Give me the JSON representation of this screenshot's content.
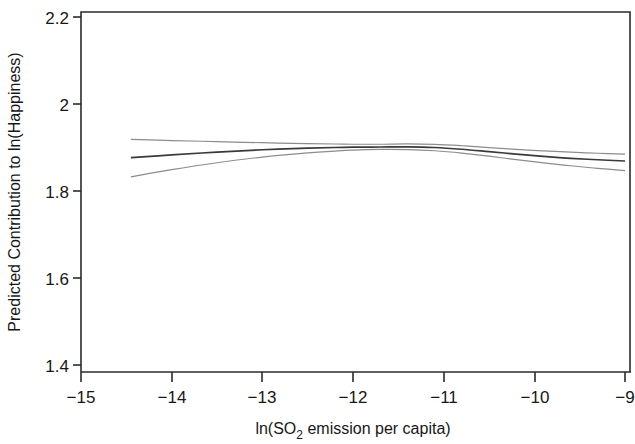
{
  "chart_data": {
    "type": "line",
    "title": "",
    "xlabel": "ln(SO2 emission per capita)",
    "xlabel_main": "ln(SO",
    "xlabel_sub": "2",
    "xlabel_tail": " emission per capita)",
    "ylabel": "Predicted Contribution to ln(Happiness)",
    "xlim": [
      -15,
      -9
    ],
    "ylim": [
      1.4,
      2.2
    ],
    "xticks": [
      -15,
      -14,
      -13,
      -12,
      -11,
      -10,
      -9
    ],
    "xtick_labels": [
      "−15",
      "−14",
      "−13",
      "−12",
      "−11",
      "−10",
      "−9"
    ],
    "yticks": [
      1.4,
      1.6,
      1.8,
      2.0,
      2.2
    ],
    "ytick_labels": [
      "1.4",
      "1.6",
      "1.8",
      "2",
      "2.2"
    ],
    "grid": false,
    "legend": "none",
    "series": [
      {
        "name": "Upper confidence band",
        "style": "thin-gray",
        "color": "#8c8c8c",
        "x": [
          -14.45,
          -14.0,
          -13.5,
          -13.0,
          -12.5,
          -12.2,
          -12.0,
          -11.7,
          -11.4,
          -11.1,
          -10.8,
          -10.5,
          -10.2,
          -9.9,
          -9.6,
          -9.3,
          -9.0
        ],
        "y": [
          1.9185,
          1.916,
          1.9135,
          1.911,
          1.909,
          1.908,
          1.9075,
          1.9075,
          1.9082,
          1.9072,
          1.904,
          1.8998,
          1.8958,
          1.8922,
          1.8892,
          1.8868,
          1.8848
        ]
      },
      {
        "name": "Fitted curve",
        "style": "solid-dark",
        "color": "#3a3a3a",
        "x": [
          -14.45,
          -14.0,
          -13.5,
          -13.0,
          -12.5,
          -12.2,
          -12.0,
          -11.7,
          -11.4,
          -11.1,
          -10.8,
          -10.5,
          -10.2,
          -9.9,
          -9.6,
          -9.3,
          -9.0
        ],
        "y": [
          1.8765,
          1.883,
          1.8895,
          1.8948,
          1.8985,
          1.9,
          1.9008,
          1.9012,
          1.9015,
          1.9,
          1.896,
          1.8905,
          1.8848,
          1.8795,
          1.8752,
          1.8718,
          1.869
        ]
      },
      {
        "name": "Lower confidence band",
        "style": "thin-gray",
        "color": "#8c8c8c",
        "x": [
          -14.45,
          -14.0,
          -13.5,
          -13.0,
          -12.5,
          -12.2,
          -12.0,
          -11.7,
          -11.4,
          -11.1,
          -10.8,
          -10.5,
          -10.2,
          -9.9,
          -9.6,
          -9.3,
          -9.0
        ],
        "y": [
          1.8325,
          1.849,
          1.865,
          1.878,
          1.8875,
          1.8918,
          1.894,
          1.8955,
          1.8952,
          1.8925,
          1.8872,
          1.88,
          1.8722,
          1.8648,
          1.858,
          1.852,
          1.847
        ]
      }
    ]
  },
  "geometry": {
    "plot_left": 81,
    "plot_right": 630,
    "plot_top": 12,
    "plot_bottom": 372,
    "x_at_minus15": 81,
    "x_at_minus9": 625,
    "y_at_2p2": 17,
    "y_at_1p4": 365
  }
}
